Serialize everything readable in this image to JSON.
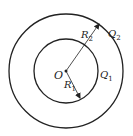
{
  "diagram": {
    "center": {
      "label": "O",
      "x": 66,
      "y": 71
    },
    "inner_circle": {
      "radius_label": "R",
      "radius_sub": "1",
      "charge_label": "Q",
      "charge_sub": "1",
      "r": 32
    },
    "outer_circle": {
      "radius_label": "R",
      "radius_sub": "2",
      "charge_label": "Q",
      "charge_sub": "2",
      "r": 57
    },
    "colors": {
      "stroke": "#222222",
      "background": "#ffffff"
    }
  }
}
